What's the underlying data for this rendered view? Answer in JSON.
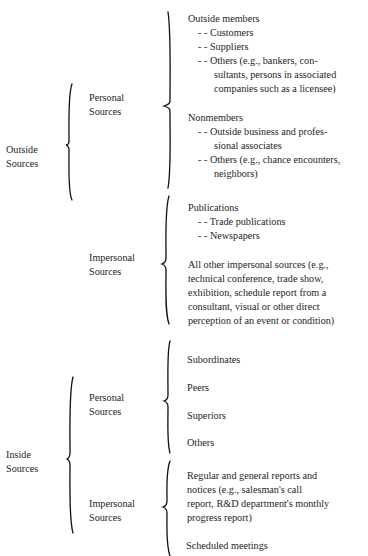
{
  "figure": {
    "outside": {
      "label": [
        "Outside",
        "Sources"
      ],
      "personal": {
        "label": [
          "Personal",
          "Sources"
        ],
        "outside_members": {
          "heading": "Outside members",
          "lines": [
            "- -  Customers",
            "- -  Suppliers",
            "- -  Others (e.g., bankers, con-",
            "sultants, persons in associated",
            "companies such as a licensee)"
          ]
        },
        "nonmembers": {
          "heading": "Nonmembers",
          "lines": [
            "- -  Outside business and profes-",
            "sional associates",
            "- -  Others (e.g., chance encounters,",
            "neighbors)"
          ]
        }
      },
      "impersonal": {
        "label": [
          "Impersonal",
          "Sources"
        ],
        "publications": {
          "heading": "Publications",
          "lines": [
            "- -  Trade publications",
            "- -  Newspapers"
          ]
        },
        "other": [
          "All other impersonal sources (e.g.,",
          "technical conference, trade show,",
          "exhibition, schedule report from a",
          "consultant, visual or other direct",
          "perception of an event or condition)"
        ]
      }
    },
    "inside": {
      "label": [
        "Inside",
        "Sources"
      ],
      "personal": {
        "label": [
          "Personal",
          "Sources"
        ],
        "items": [
          "Subordinates",
          "Peers",
          "Superiors",
          "Others"
        ]
      },
      "impersonal": {
        "label": [
          "Impersonal",
          "Sources"
        ],
        "reports": [
          "Regular and general reports and",
          "notices (e.g., salesman's call",
          "report, R&D department's monthly",
          "progress report)"
        ],
        "meetings": "Scheduled meetings"
      }
    }
  }
}
